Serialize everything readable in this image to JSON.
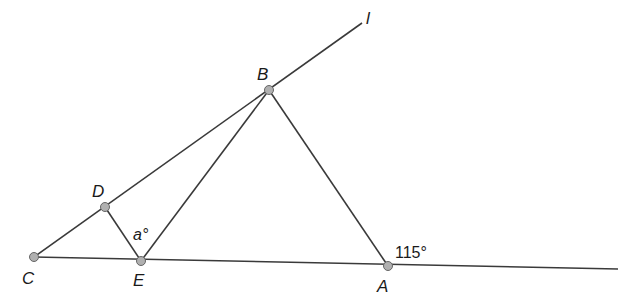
{
  "diagram": {
    "stroke_color": "#3a3a3a",
    "point_fill": "#b0b0b0",
    "points": {
      "A": {
        "label": "A",
        "x": 388,
        "y": 266
      },
      "B": {
        "label": "B",
        "x": 269,
        "y": 90
      },
      "C": {
        "label": "C",
        "x": 34,
        "y": 257
      },
      "D": {
        "label": "D",
        "x": 105,
        "y": 207
      },
      "E": {
        "label": "E",
        "x": 141,
        "y": 261
      }
    },
    "line_l": {
      "label": "l"
    },
    "angles": {
      "at_E": "a°",
      "at_A": "115°"
    }
  }
}
